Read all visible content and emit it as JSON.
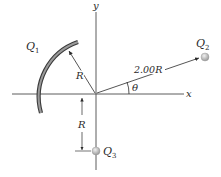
{
  "diagram": {
    "axes": {
      "x_label": "x",
      "y_label": "y"
    },
    "charges": {
      "q1": {
        "label": "Q",
        "subscript": "1",
        "shape": "circular arc of radius R"
      },
      "q2": {
        "label": "Q",
        "subscript": "2"
      },
      "q3": {
        "label": "Q",
        "subscript": "3"
      }
    },
    "dimensions": {
      "arc_radius": "R",
      "q2_distance": "2.00R",
      "q3_distance": "R",
      "angle": "θ"
    },
    "colors": {
      "arc": "#7a7a7a",
      "charge": "#b8b8b8",
      "axis": "#4a4a4a"
    }
  }
}
